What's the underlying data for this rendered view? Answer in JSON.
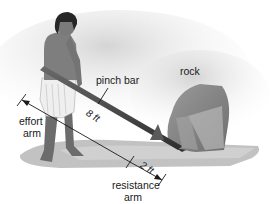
{
  "diagram": {
    "type": "lever illustration",
    "labels": {
      "bar": "pinch bar",
      "object": "rock",
      "effort_arm_line1": "effort",
      "effort_arm_line2": "arm",
      "resistance_arm_line1": "resistance",
      "resistance_arm_line2": "arm"
    },
    "dimensions": {
      "effort_length": "8 ft",
      "resistance_length": "2 ft"
    },
    "colors": {
      "background": "#ffffff",
      "ground_shadow": "#b8b8b8",
      "ground_highlight": "#d4d4d4",
      "bar": "#4a4a4a",
      "rock": "#8a8a8a",
      "skin": "#7a7a7a",
      "hair": "#2a2a2a",
      "cloth": "#f2f2f2",
      "dimension_line": "#1a1a1a"
    }
  }
}
